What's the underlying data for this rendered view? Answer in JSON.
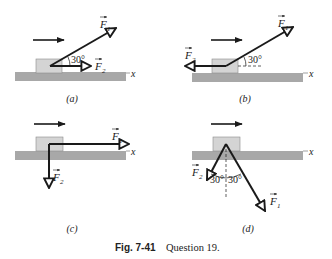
{
  "figure": {
    "caption_label": "Fig. 7-41",
    "caption_text": "Question 19."
  },
  "colors": {
    "ground": "#a8a8a8",
    "block": "#d4d4d4",
    "block_border": "#8a8a8a",
    "vector": "#1a1a1a"
  },
  "panels": [
    {
      "id": "a",
      "label": "(a)",
      "axis_label": "x",
      "vectors": [
        {
          "name": "F1",
          "label": "F",
          "subscript": "1",
          "angle_label": "30°",
          "direction": "up-right at 30° above +x"
        },
        {
          "name": "F2",
          "label": "F",
          "subscript": "2",
          "direction": "+x"
        }
      ],
      "motion_arrow": "right"
    },
    {
      "id": "b",
      "label": "(b)",
      "axis_label": "x",
      "vectors": [
        {
          "name": "F1",
          "label": "F",
          "subscript": "1",
          "angle_label": "30°",
          "direction": "up-right at 30° above +x"
        },
        {
          "name": "F2",
          "label": "F",
          "subscript": "2",
          "direction": "-x"
        }
      ],
      "motion_arrow": "right"
    },
    {
      "id": "c",
      "label": "(c)",
      "axis_label": "x",
      "vectors": [
        {
          "name": "F1",
          "label": "F",
          "subscript": "1",
          "direction": "+x"
        },
        {
          "name": "F2",
          "label": "F",
          "subscript": "2",
          "direction": "-y"
        }
      ],
      "motion_arrow": "right"
    },
    {
      "id": "d",
      "label": "(d)",
      "axis_label": "x",
      "vectors": [
        {
          "name": "F1",
          "label": "F",
          "subscript": "1",
          "angle_label": "30°",
          "direction": "down-right, 30° from -y"
        },
        {
          "name": "F2",
          "label": "F",
          "subscript": "2",
          "angle_label": "30°",
          "direction": "down-left, 30° from -y"
        }
      ],
      "motion_arrow": "right"
    }
  ]
}
